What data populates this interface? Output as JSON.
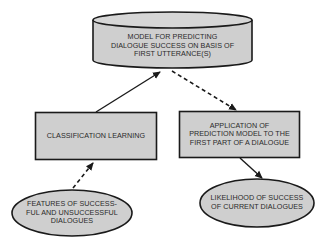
{
  "diagram": {
    "colors": {
      "fill": "#cfcfcf",
      "stroke": "#1a1a1a",
      "text": "#2a2a2a",
      "background": "#ffffff"
    },
    "nodes": {
      "model": {
        "shape": "cylinder",
        "label": "MODEL FOR PREDICTING\nDIALOGUE SUCCESS ON BASIS OF\nFIRST UTTERANCE(S)"
      },
      "classification": {
        "shape": "rectangle",
        "label": "CLASSIFICATION LEARNING"
      },
      "application": {
        "shape": "rectangle",
        "label": "APPLICATION OF\nPREDICTION MODEL TO THE\nFIRST PART OF A DIALOGUE"
      },
      "features": {
        "shape": "ellipse",
        "label": "FEATURES OF SUCCESS-\nFUL AND UNSUCCESSFUL\nDIALOGUES"
      },
      "likelihood": {
        "shape": "ellipse",
        "label": "LIKELIHOOD OF SUCCESS\nOF CURRENT DIALOGUES"
      }
    },
    "edges": [
      {
        "from": "features",
        "to": "classification",
        "style": "dashed"
      },
      {
        "from": "classification",
        "to": "model",
        "style": "solid"
      },
      {
        "from": "model",
        "to": "application",
        "style": "dashed"
      },
      {
        "from": "application",
        "to": "likelihood",
        "style": "solid"
      }
    ]
  }
}
